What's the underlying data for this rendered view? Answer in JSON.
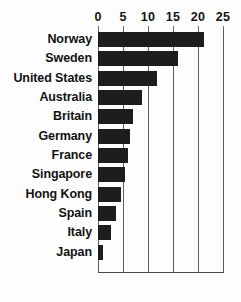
{
  "chart_data": {
    "type": "bar",
    "orientation": "horizontal",
    "title": "",
    "subtitle": "",
    "xlabel": "",
    "ylabel": "",
    "xlim": [
      0,
      25
    ],
    "xticks": [
      0,
      5,
      10,
      15,
      20,
      25
    ],
    "xtick_labels": [
      "0",
      "5",
      "10",
      "15",
      "20",
      "25"
    ],
    "grid": true,
    "grid_axis": "x",
    "legend": false,
    "legend_position": "none",
    "axis_labels_position": "top",
    "categories": [
      "Norway",
      "Sweden",
      "United States",
      "Australia",
      "Britain",
      "Germany",
      "France",
      "Singapore",
      "Hong Kong",
      "Spain",
      "Italy",
      "Japan"
    ],
    "values": [
      21.2,
      16.0,
      11.8,
      8.7,
      7.0,
      6.3,
      6.0,
      5.4,
      4.5,
      3.6,
      2.5,
      1.0
    ],
    "bar_color": "#1d1d1d",
    "background_color": "#fdfdfd",
    "gridline_color": "#5d5d5d",
    "text_color": "#121212"
  }
}
